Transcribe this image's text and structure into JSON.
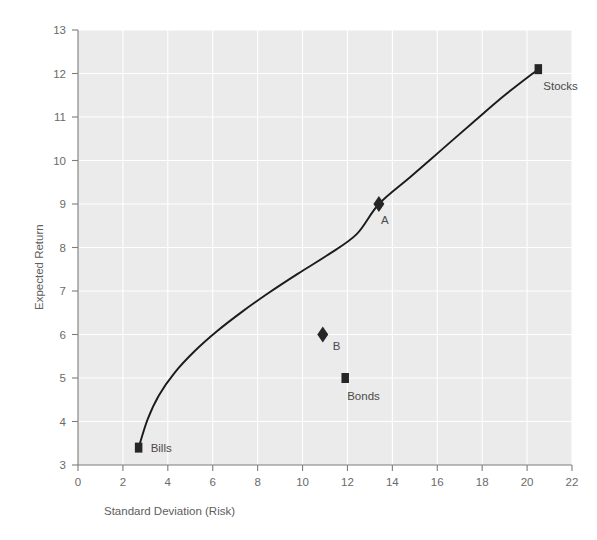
{
  "chart_data": {
    "type": "scatter",
    "title": "",
    "subtitle": "",
    "xlabel": "Standard Deviation (Risk)",
    "ylabel": "Expected Return",
    "xlim": [
      0,
      22
    ],
    "ylim": [
      3,
      13
    ],
    "xticks": [
      0,
      2,
      4,
      6,
      8,
      10,
      12,
      14,
      16,
      18,
      20,
      22
    ],
    "yticks": [
      3,
      4,
      5,
      6,
      7,
      8,
      9,
      10,
      11,
      12,
      13
    ],
    "xtick_labels": [
      "0",
      "2",
      "4",
      "6",
      "8",
      "10",
      "12",
      "14",
      "16",
      "18",
      "20",
      "22"
    ],
    "ytick_labels": [
      "3",
      "4",
      "5",
      "6",
      "7",
      "8",
      "9",
      "10",
      "11",
      "12",
      "13"
    ],
    "grid": true,
    "legend": "none",
    "plot_background": "#ebebeb",
    "gridline_color": "#ffffff",
    "marker_color": "#262626",
    "curve_color": "#1b1b1b",
    "points": [
      {
        "label": "Bills",
        "x": 2.7,
        "y": 3.4,
        "marker": "square",
        "label_dx": 12,
        "label_dy": 4
      },
      {
        "label": "B",
        "x": 10.9,
        "y": 6.0,
        "marker": "diamond",
        "label_dx": 10,
        "label_dy": 15
      },
      {
        "label": "Bonds",
        "x": 11.9,
        "y": 5.0,
        "marker": "square",
        "label_dx": 2,
        "label_dy": 22
      },
      {
        "label": "A",
        "x": 13.4,
        "y": 9.0,
        "marker": "diamond",
        "label_dx": 2,
        "label_dy": 20
      },
      {
        "label": "Stocks",
        "x": 20.5,
        "y": 12.1,
        "marker": "square",
        "label_dx": 5,
        "label_dy": 21
      }
    ],
    "series": [
      {
        "name": "Efficient Frontier",
        "type": "line",
        "x": [
          2.7,
          3.1,
          3.6,
          4.3,
          5.2,
          6.2,
          7.3,
          8.5,
          9.8,
          11.1,
          12.4,
          13.4,
          14.8,
          16.2,
          17.6,
          19.0,
          20.5
        ],
        "y": [
          3.4,
          4.05,
          4.6,
          5.12,
          5.62,
          6.08,
          6.52,
          6.96,
          7.4,
          7.82,
          8.3,
          9.0,
          9.62,
          10.25,
          10.88,
          11.5,
          12.1
        ]
      }
    ]
  }
}
